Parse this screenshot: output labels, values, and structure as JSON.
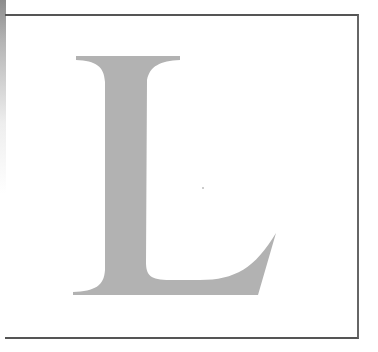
{
  "image": {
    "letter": "L",
    "letter_color": "#b2b2b2",
    "frame_color": "#555555",
    "background": "#ffffff"
  }
}
